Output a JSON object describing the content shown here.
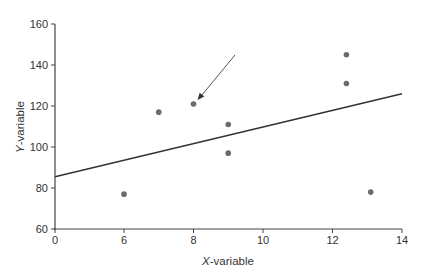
{
  "caption": {
    "text": ""
  },
  "chart_data": {
    "type": "scatter",
    "title": "",
    "xlabel": "X-variable",
    "ylabel": "Y-variable",
    "xlim": [
      0,
      14
    ],
    "ylim": [
      60,
      160
    ],
    "x_axis_break": "axis jumps from 0 to 6",
    "x_ticks": [
      "0",
      "6",
      "8",
      "10",
      "12",
      "14"
    ],
    "y_ticks": [
      "60",
      "80",
      "100",
      "120",
      "140",
      "160"
    ],
    "grid": false,
    "legend": null,
    "series": [
      {
        "name": "observations",
        "points": [
          {
            "x": 6.0,
            "y": 77
          },
          {
            "x": 7.0,
            "y": 117
          },
          {
            "x": 8.0,
            "y": 121
          },
          {
            "x": 9.0,
            "y": 111
          },
          {
            "x": 9.0,
            "y": 97
          },
          {
            "x": 12.4,
            "y": 145
          },
          {
            "x": 12.4,
            "y": 131
          },
          {
            "x": 13.1,
            "y": 78
          }
        ]
      }
    ],
    "regression_line": {
      "x_start": 0,
      "y_start": 85.5,
      "x_end": 14,
      "y_end": 126
    },
    "annotations": [
      {
        "type": "arrow",
        "points_to": {
          "x": 8.0,
          "y": 121
        },
        "label": ""
      }
    ]
  },
  "axes": {
    "x_title_prefix": "X",
    "x_title_suffix": "-variable",
    "y_title_prefix": "Y",
    "y_title_suffix": "-variable"
  }
}
